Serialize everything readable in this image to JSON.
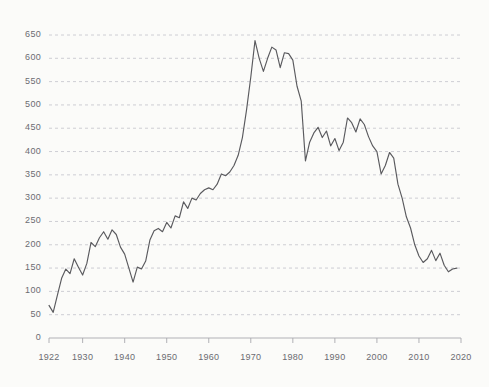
{
  "chart_data": {
    "type": "line",
    "title": "",
    "subtitle": "",
    "xlabel": "",
    "ylabel": "",
    "xlim": [
      1922,
      2020
    ],
    "ylim": [
      0,
      650
    ],
    "grid": true,
    "grid_axis": "y",
    "grid_style": "dashed",
    "legend": false,
    "legend_position": "none",
    "line_color": "#5a5a5e",
    "background_color": "#fbfbf9",
    "axis_color": "#9a9aa0",
    "tick_label_color": "#6b6b72",
    "ytick_values": [
      0,
      50,
      100,
      150,
      200,
      250,
      300,
      350,
      400,
      450,
      500,
      550,
      600,
      650
    ],
    "ytick_labels": [
      "0",
      "50",
      "100",
      "150",
      "200",
      "250",
      "300",
      "350",
      "400",
      "450",
      "500",
      "550",
      "600",
      "650"
    ],
    "xtick_values": [
      1922,
      1930,
      1940,
      1950,
      1960,
      1970,
      1980,
      1990,
      2000,
      2010,
      2020
    ],
    "xtick_labels": [
      "1922",
      "1930",
      "1940",
      "1950",
      "1960",
      "1970",
      "1980",
      "1990",
      "2000",
      "2010",
      "2020"
    ],
    "series": [
      {
        "name": "series-1",
        "x": [
          1922,
          1923,
          1924,
          1925,
          1926,
          1927,
          1928,
          1929,
          1930,
          1931,
          1932,
          1933,
          1934,
          1935,
          1936,
          1937,
          1938,
          1939,
          1940,
          1941,
          1942,
          1943,
          1944,
          1945,
          1946,
          1947,
          1948,
          1949,
          1950,
          1951,
          1952,
          1953,
          1954,
          1955,
          1956,
          1957,
          1958,
          1959,
          1960,
          1961,
          1962,
          1963,
          1964,
          1965,
          1966,
          1967,
          1968,
          1969,
          1970,
          1971,
          1972,
          1973,
          1974,
          1975,
          1976,
          1977,
          1978,
          1979,
          1980,
          1981,
          1982,
          1983,
          1984,
          1985,
          1986,
          1987,
          1988,
          1989,
          1990,
          1991,
          1992,
          1993,
          1994,
          1995,
          1996,
          1997,
          1998,
          1999,
          2000,
          2001,
          2002,
          2003,
          2004,
          2005,
          2006,
          2007,
          2008,
          2009,
          2010,
          2011,
          2012,
          2013,
          2014,
          2015,
          2016,
          2017,
          2018,
          2019
        ],
        "values": [
          70,
          55,
          92,
          128,
          148,
          138,
          170,
          152,
          135,
          160,
          205,
          196,
          215,
          228,
          212,
          232,
          222,
          195,
          180,
          150,
          120,
          152,
          148,
          165,
          210,
          230,
          235,
          228,
          248,
          236,
          262,
          258,
          292,
          278,
          300,
          296,
          310,
          318,
          322,
          318,
          330,
          352,
          348,
          356,
          370,
          392,
          430,
          490,
          560,
          638,
          600,
          572,
          600,
          624,
          618,
          580,
          612,
          610,
          596,
          540,
          508,
          380,
          420,
          440,
          452,
          430,
          444,
          412,
          428,
          402,
          420,
          472,
          462,
          442,
          470,
          458,
          432,
          412,
          400,
          352,
          370,
          398,
          386,
          330,
          300,
          260,
          236,
          200,
          176,
          162,
          170,
          188,
          166,
          182,
          156,
          142,
          148,
          150
        ]
      }
    ]
  }
}
